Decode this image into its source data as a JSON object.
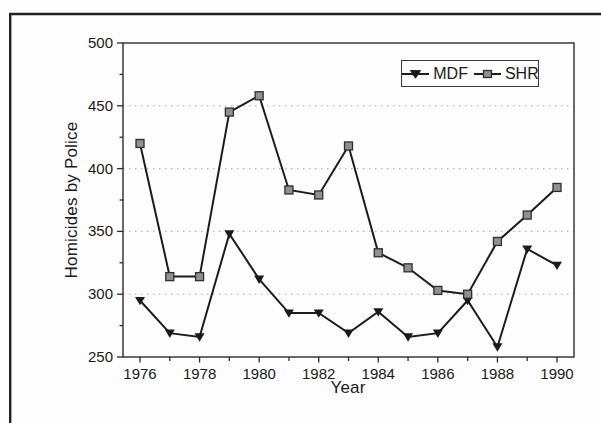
{
  "figure": {
    "frame_color": "#222222",
    "background": "#fdfdfd"
  },
  "chart_data": {
    "type": "line",
    "title": "",
    "xlabel": "Year",
    "ylabel": "Homicides by Police",
    "x": [
      1976,
      1977,
      1978,
      1979,
      1980,
      1981,
      1982,
      1983,
      1984,
      1985,
      1986,
      1987,
      1988,
      1989,
      1990
    ],
    "xtick_labels": [
      1976,
      1978,
      1980,
      1982,
      1984,
      1986,
      1988,
      1990
    ],
    "ylim": [
      250,
      500
    ],
    "yticks": [
      250,
      300,
      350,
      400,
      450,
      500
    ],
    "yticks_minor": [
      275,
      325,
      375,
      425,
      475
    ],
    "grid": "horizontal-dotted",
    "grid_color": "#b5b5b5",
    "axis_color": "#2b2b2b",
    "legend_position": "top-right",
    "series": [
      {
        "name": "MDF",
        "marker": "triangle-down",
        "line_color": "#1c1c1c",
        "marker_fill": "#1a1a1a",
        "marker_stroke": "#1a1a1a",
        "values": [
          295,
          269,
          266,
          348,
          312,
          285,
          285,
          269,
          286,
          266,
          269,
          295,
          258,
          336,
          323
        ]
      },
      {
        "name": "SHR",
        "marker": "square",
        "line_color": "#1c1c1c",
        "marker_fill": "#909090",
        "marker_stroke": "#2e2e2e",
        "values": [
          420,
          314,
          314,
          445,
          458,
          383,
          379,
          418,
          333,
          321,
          303,
          300,
          342,
          363,
          385
        ]
      }
    ]
  }
}
